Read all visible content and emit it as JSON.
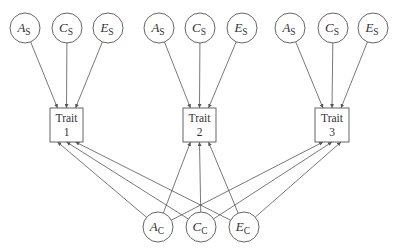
{
  "diagram": {
    "type": "path-diagram",
    "colors": {
      "stroke": "#555555",
      "text": "#333333",
      "background": "#ffffff"
    },
    "traits": [
      {
        "id": "trait1",
        "line1": "Trait",
        "line2": "1",
        "x": 50,
        "y": 108,
        "w": 33,
        "h": 34
      },
      {
        "id": "trait2",
        "line1": "Trait",
        "line2": "2",
        "x": 183,
        "y": 108,
        "w": 33,
        "h": 34
      },
      {
        "id": "trait3",
        "line1": "Trait",
        "line2": "3",
        "x": 315,
        "y": 108,
        "w": 34,
        "h": 34
      }
    ],
    "specific_factors": [
      {
        "id": "t1_as",
        "letter": "A",
        "sub": "S",
        "cx": 25,
        "cy": 28,
        "target": "trait1"
      },
      {
        "id": "t1_cs",
        "letter": "C",
        "sub": "S",
        "cx": 67,
        "cy": 28,
        "target": "trait1"
      },
      {
        "id": "t1_es",
        "letter": "E",
        "sub": "S",
        "cx": 108,
        "cy": 28,
        "target": "trait1"
      },
      {
        "id": "t2_as",
        "letter": "A",
        "sub": "S",
        "cx": 159,
        "cy": 28,
        "target": "trait2"
      },
      {
        "id": "t2_cs",
        "letter": "C",
        "sub": "S",
        "cx": 200,
        "cy": 28,
        "target": "trait2"
      },
      {
        "id": "t2_es",
        "letter": "E",
        "sub": "S",
        "cx": 242,
        "cy": 28,
        "target": "trait2"
      },
      {
        "id": "t3_as",
        "letter": "A",
        "sub": "S",
        "cx": 290,
        "cy": 28,
        "target": "trait3"
      },
      {
        "id": "t3_cs",
        "letter": "C",
        "sub": "S",
        "cx": 333,
        "cy": 28,
        "target": "trait3"
      },
      {
        "id": "t3_es",
        "letter": "E",
        "sub": "S",
        "cx": 373,
        "cy": 28,
        "target": "trait3"
      }
    ],
    "common_factors": [
      {
        "id": "ac",
        "letter": "A",
        "sub": "C",
        "cx": 158,
        "cy": 227
      },
      {
        "id": "cc",
        "letter": "C",
        "sub": "C",
        "cx": 201,
        "cy": 227
      },
      {
        "id": "ec",
        "letter": "E",
        "sub": "C",
        "cx": 244,
        "cy": 227
      }
    ],
    "circle_radius": 15
  }
}
